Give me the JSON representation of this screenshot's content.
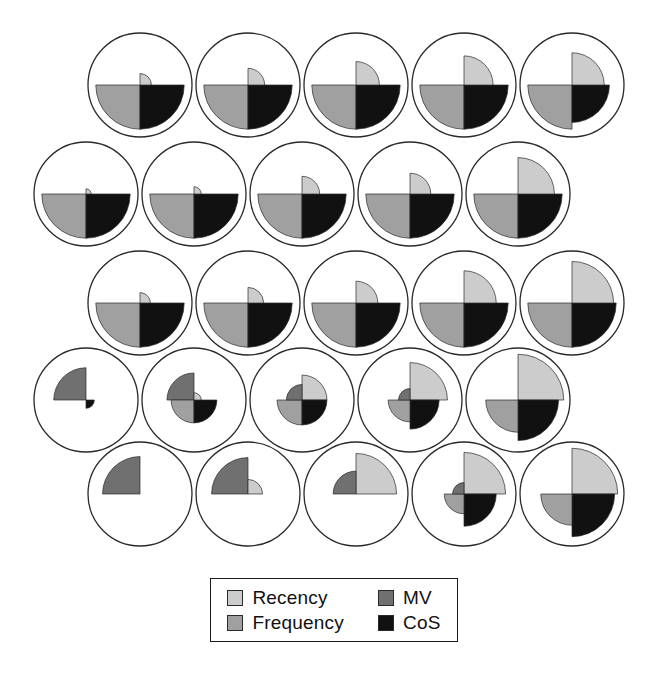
{
  "figure": {
    "type": "small-multiples-rose-chart-grid",
    "rows": 5,
    "cols": 5,
    "background": "#ffffff",
    "circle_stroke": "#2a2a2a",
    "circle_radius": 52
  },
  "legend": {
    "position": "bottom-center",
    "border_color": "#1a1a1a",
    "items": [
      {
        "label": "Recency",
        "color": "#cccccc",
        "quadrant": "top-right"
      },
      {
        "label": "MV",
        "color": "#707070",
        "quadrant": "top-left"
      },
      {
        "label": "Frequency",
        "color": "#a0a0a0",
        "quadrant": "bottom-left"
      },
      {
        "label": "CoS",
        "color": "#111111",
        "quadrant": "bottom-right"
      }
    ],
    "order": [
      "Recency",
      "MV",
      "Frequency",
      "CoS"
    ]
  },
  "chart_data": {
    "type": "pie",
    "title": "",
    "subtitle": "",
    "xlabel": "",
    "ylabel": "",
    "grid": false,
    "legend_position": "bottom-center",
    "variables": [
      "Recency",
      "MV",
      "Frequency",
      "CoS"
    ],
    "quadrant_map": {
      "Recency": "top-right",
      "MV": "top-left",
      "Frequency": "bottom-left",
      "CoS": "bottom-right"
    },
    "cell_centers_x": [
      140,
      248,
      356,
      464,
      572
    ],
    "row_centers_y": [
      85,
      194,
      303,
      400,
      494
    ],
    "row_x_offset": [
      0,
      -54,
      0,
      -54,
      0
    ],
    "cells": [
      {
        "row": 1,
        "col": 1,
        "Recency": 0.22,
        "MV": 0.0,
        "Frequency": 0.85,
        "CoS": 0.85
      },
      {
        "row": 1,
        "col": 2,
        "Recency": 0.32,
        "MV": 0.0,
        "Frequency": 0.85,
        "CoS": 0.85
      },
      {
        "row": 1,
        "col": 3,
        "Recency": 0.45,
        "MV": 0.0,
        "Frequency": 0.85,
        "CoS": 0.85
      },
      {
        "row": 1,
        "col": 4,
        "Recency": 0.56,
        "MV": 0.0,
        "Frequency": 0.85,
        "CoS": 0.85
      },
      {
        "row": 1,
        "col": 5,
        "Recency": 0.62,
        "MV": 0.0,
        "Frequency": 0.85,
        "CoS": 0.72
      },
      {
        "row": 2,
        "col": 1,
        "Recency": 0.1,
        "MV": 0.0,
        "Frequency": 0.85,
        "CoS": 0.85
      },
      {
        "row": 2,
        "col": 2,
        "Recency": 0.14,
        "MV": 0.0,
        "Frequency": 0.85,
        "CoS": 0.85
      },
      {
        "row": 2,
        "col": 3,
        "Recency": 0.34,
        "MV": 0.0,
        "Frequency": 0.85,
        "CoS": 0.85
      },
      {
        "row": 2,
        "col": 4,
        "Recency": 0.4,
        "MV": 0.0,
        "Frequency": 0.85,
        "CoS": 0.85
      },
      {
        "row": 2,
        "col": 5,
        "Recency": 0.7,
        "MV": 0.0,
        "Frequency": 0.85,
        "CoS": 0.85
      },
      {
        "row": 3,
        "col": 1,
        "Recency": 0.2,
        "MV": 0.0,
        "Frequency": 0.85,
        "CoS": 0.85
      },
      {
        "row": 3,
        "col": 2,
        "Recency": 0.3,
        "MV": 0.0,
        "Frequency": 0.85,
        "CoS": 0.85
      },
      {
        "row": 3,
        "col": 3,
        "Recency": 0.42,
        "MV": 0.0,
        "Frequency": 0.85,
        "CoS": 0.85
      },
      {
        "row": 3,
        "col": 4,
        "Recency": 0.62,
        "MV": 0.0,
        "Frequency": 0.85,
        "CoS": 0.85
      },
      {
        "row": 3,
        "col": 5,
        "Recency": 0.8,
        "MV": 0.0,
        "Frequency": 0.85,
        "CoS": 0.85
      },
      {
        "row": 4,
        "col": 1,
        "Recency": 0.0,
        "MV": 0.62,
        "Frequency": 0.0,
        "CoS": 0.16
      },
      {
        "row": 4,
        "col": 2,
        "Recency": 0.14,
        "MV": 0.52,
        "Frequency": 0.44,
        "CoS": 0.44
      },
      {
        "row": 4,
        "col": 3,
        "Recency": 0.48,
        "MV": 0.3,
        "Frequency": 0.48,
        "CoS": 0.48
      },
      {
        "row": 4,
        "col": 4,
        "Recency": 0.72,
        "MV": 0.22,
        "Frequency": 0.42,
        "CoS": 0.56
      },
      {
        "row": 4,
        "col": 5,
        "Recency": 0.88,
        "MV": 0.0,
        "Frequency": 0.62,
        "CoS": 0.78
      },
      {
        "row": 5,
        "col": 1,
        "Recency": 0.0,
        "MV": 0.72,
        "Frequency": 0.0,
        "CoS": 0.0
      },
      {
        "row": 5,
        "col": 2,
        "Recency": 0.28,
        "MV": 0.7,
        "Frequency": 0.0,
        "CoS": 0.0
      },
      {
        "row": 5,
        "col": 3,
        "Recency": 0.78,
        "MV": 0.44,
        "Frequency": 0.0,
        "CoS": 0.0
      },
      {
        "row": 5,
        "col": 4,
        "Recency": 0.8,
        "MV": 0.22,
        "Frequency": 0.38,
        "CoS": 0.62
      },
      {
        "row": 5,
        "col": 5,
        "Recency": 0.88,
        "MV": 0.0,
        "Frequency": 0.6,
        "CoS": 0.82
      }
    ]
  }
}
